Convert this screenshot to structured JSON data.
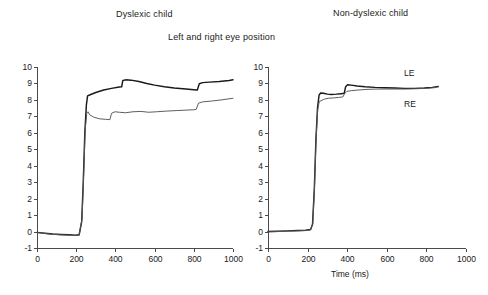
{
  "figure": {
    "main_title": "Left and right eye position",
    "xaxis_title": "Time (ms)",
    "panels": [
      {
        "key": "left",
        "title": "Dyslexic child"
      },
      {
        "key": "right",
        "title": "Non-dyslexic child"
      }
    ],
    "trace_labels": {
      "le": "LE",
      "re": "RE"
    }
  },
  "axes": {
    "y_ticks": [
      "10",
      "9",
      "8",
      "7",
      "6",
      "5",
      "4",
      "3",
      "2",
      "1",
      "0",
      "-1"
    ],
    "x_ticks": [
      "0",
      "200",
      "400",
      "600",
      "800",
      "1000"
    ]
  },
  "chart_data": {
    "type": "line",
    "title": "Left and right eye position",
    "subtitle": "",
    "xlabel": "Time (ms)",
    "ylabel": "",
    "xlim": [
      0,
      1000
    ],
    "ylim": [
      -1,
      10
    ],
    "x_ticks": [
      0,
      200,
      400,
      600,
      800,
      1000
    ],
    "y_ticks": [
      -1,
      0,
      1,
      2,
      3,
      4,
      5,
      6,
      7,
      8,
      9,
      10
    ],
    "grid": false,
    "legend": "inline-annotation",
    "legend_position": "right-panel-inline",
    "panels": [
      {
        "name": "Dyslexic child",
        "series": [
          {
            "name": "LE",
            "label": "Left eye",
            "color": "#1a1a1a",
            "points": [
              [
                0,
                -0.05
              ],
              [
                40,
                -0.1
              ],
              [
                80,
                -0.15
              ],
              [
                120,
                -0.18
              ],
              [
                160,
                -0.2
              ],
              [
                195,
                -0.22
              ],
              [
                215,
                -0.2
              ],
              [
                228,
                0.6
              ],
              [
                236,
                3.0
              ],
              [
                244,
                6.0
              ],
              [
                252,
                7.7
              ],
              [
                258,
                8.25
              ],
              [
                268,
                8.3
              ],
              [
                300,
                8.45
              ],
              [
                340,
                8.6
              ],
              [
                380,
                8.7
              ],
              [
                420,
                8.78
              ],
              [
                432,
                8.8
              ],
              [
                438,
                9.18
              ],
              [
                452,
                9.22
              ],
              [
                480,
                9.2
              ],
              [
                520,
                9.12
              ],
              [
                560,
                9.0
              ],
              [
                600,
                8.9
              ],
              [
                650,
                8.8
              ],
              [
                700,
                8.72
              ],
              [
                760,
                8.66
              ],
              [
                800,
                8.62
              ],
              [
                818,
                8.6
              ],
              [
                828,
                8.98
              ],
              [
                845,
                9.05
              ],
              [
                880,
                9.08
              ],
              [
                930,
                9.12
              ],
              [
                980,
                9.18
              ],
              [
                1000,
                9.22
              ]
            ]
          },
          {
            "name": "RE",
            "label": "Right eye",
            "color": "#555555",
            "points": [
              [
                0,
                -0.06
              ],
              [
                40,
                -0.12
              ],
              [
                80,
                -0.17
              ],
              [
                120,
                -0.2
              ],
              [
                160,
                -0.22
              ],
              [
                195,
                -0.24
              ],
              [
                215,
                -0.22
              ],
              [
                230,
                0.8
              ],
              [
                238,
                3.4
              ],
              [
                246,
                6.2
              ],
              [
                254,
                7.2
              ],
              [
                260,
                7.28
              ],
              [
                268,
                7.1
              ],
              [
                290,
                6.95
              ],
              [
                320,
                6.85
              ],
              [
                350,
                6.82
              ],
              [
                372,
                6.8
              ],
              [
                380,
                7.18
              ],
              [
                398,
                7.28
              ],
              [
                420,
                7.25
              ],
              [
                452,
                7.22
              ],
              [
                490,
                7.28
              ],
              [
                530,
                7.3
              ],
              [
                570,
                7.25
              ],
              [
                610,
                7.28
              ],
              [
                660,
                7.32
              ],
              [
                710,
                7.35
              ],
              [
                760,
                7.38
              ],
              [
                800,
                7.4
              ],
              [
                812,
                7.42
              ],
              [
                824,
                7.8
              ],
              [
                845,
                7.88
              ],
              [
                890,
                7.93
              ],
              [
                940,
                8.0
              ],
              [
                1000,
                8.1
              ]
            ]
          }
        ]
      },
      {
        "name": "Non-dyslexic child",
        "series": [
          {
            "name": "LE",
            "label": "Left eye",
            "color": "#1a1a1a",
            "points": [
              [
                0,
                0.0
              ],
              [
                50,
                0.02
              ],
              [
                100,
                0.04
              ],
              [
                150,
                0.06
              ],
              [
                190,
                0.08
              ],
              [
                215,
                0.12
              ],
              [
                225,
                0.45
              ],
              [
                234,
                2.6
              ],
              [
                242,
                5.6
              ],
              [
                250,
                7.5
              ],
              [
                258,
                8.3
              ],
              [
                266,
                8.42
              ],
              [
                280,
                8.4
              ],
              [
                300,
                8.35
              ],
              [
                320,
                8.33
              ],
              [
                345,
                8.35
              ],
              [
                370,
                8.38
              ],
              [
                385,
                8.4
              ],
              [
                392,
                8.8
              ],
              [
                402,
                8.92
              ],
              [
                420,
                8.9
              ],
              [
                450,
                8.85
              ],
              [
                490,
                8.8
              ],
              [
                540,
                8.76
              ],
              [
                590,
                8.74
              ],
              [
                640,
                8.72
              ],
              [
                690,
                8.7
              ],
              [
                740,
                8.7
              ],
              [
                790,
                8.72
              ],
              [
                830,
                8.76
              ],
              [
                860,
                8.82
              ]
            ]
          },
          {
            "name": "RE",
            "label": "Right eye",
            "color": "#555555",
            "points": [
              [
                0,
                -0.02
              ],
              [
                50,
                0.0
              ],
              [
                100,
                0.02
              ],
              [
                150,
                0.04
              ],
              [
                190,
                0.06
              ],
              [
                215,
                0.1
              ],
              [
                226,
                0.5
              ],
              [
                235,
                2.7
              ],
              [
                243,
                5.7
              ],
              [
                251,
                7.4
              ],
              [
                259,
                7.9
              ],
              [
                268,
                7.95
              ],
              [
                285,
                8.05
              ],
              [
                305,
                8.1
              ],
              [
                330,
                8.12
              ],
              [
                355,
                8.15
              ],
              [
                378,
                8.18
              ],
              [
                388,
                8.4
              ],
              [
                398,
                8.52
              ],
              [
                420,
                8.56
              ],
              [
                455,
                8.6
              ],
              [
                500,
                8.64
              ],
              [
                550,
                8.66
              ],
              [
                600,
                8.66
              ],
              [
                650,
                8.66
              ],
              [
                700,
                8.66
              ],
              [
                750,
                8.68
              ],
              [
                800,
                8.7
              ],
              [
                840,
                8.74
              ],
              [
                860,
                8.8
              ]
            ]
          }
        ]
      }
    ]
  }
}
